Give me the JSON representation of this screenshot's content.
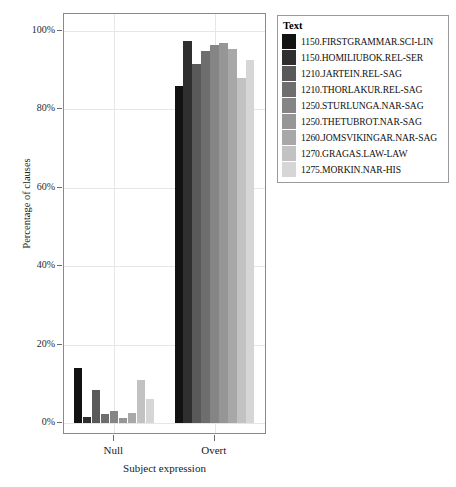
{
  "chart_data": {
    "type": "bar",
    "title": "",
    "xlabel": "Subject expression",
    "ylabel": "Percentage of clauses",
    "categories": [
      "Null",
      "Overt"
    ],
    "ylim": [
      0,
      100
    ],
    "yticks": [
      0,
      20,
      40,
      60,
      80,
      100
    ],
    "ytick_labels": [
      "0%",
      "20%",
      "40%",
      "60%",
      "80%",
      "100%"
    ],
    "grid": true,
    "legend_position": "right",
    "legend_title": "Text",
    "units": "percent",
    "series": [
      {
        "name": "1150.FIRSTGRAMMAR.SCI-LIN",
        "color": "#121212",
        "values": [
          14.0,
          86.0
        ]
      },
      {
        "name": "1150.HOMILIUBOK.REL-SER",
        "color": "#2f2f2f",
        "values": [
          1.5,
          97.5
        ]
      },
      {
        "name": "1210.JARTEIN.REL-SAG",
        "color": "#595959",
        "values": [
          8.5,
          91.5
        ]
      },
      {
        "name": "1210.THORLAKUR.REL-SAG",
        "color": "#6e6e6e",
        "values": [
          2.2,
          95.0
        ]
      },
      {
        "name": "1250.STURLUNGA.NAR-SAG",
        "color": "#858585",
        "values": [
          3.0,
          96.5
        ]
      },
      {
        "name": "1250.THETUBROT.NAR-SAG",
        "color": "#969696",
        "values": [
          1.2,
          97.0
        ]
      },
      {
        "name": "1260.JOMSVIKINGAR.NAR-SAG",
        "color": "#a8a8a8",
        "values": [
          2.5,
          95.5
        ]
      },
      {
        "name": "1270.GRAGAS.LAW-LAW",
        "color": "#c2c2c2",
        "values": [
          11.0,
          88.0
        ]
      },
      {
        "name": "1275.MORKIN.NAR-HIS",
        "color": "#d6d6d6",
        "values": [
          6.0,
          92.5
        ]
      }
    ]
  },
  "axis_colors": {
    "frame": "#8a8a8a",
    "grid": "#e6e6e6",
    "tick": "#6a6a6a",
    "text": "#1a1a1a"
  }
}
